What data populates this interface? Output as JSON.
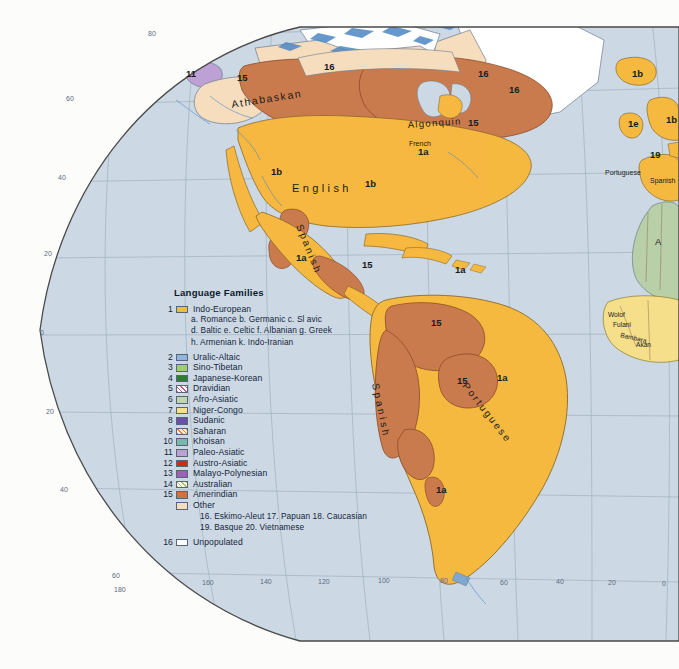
{
  "map": {
    "title": "World Language Families",
    "projection_note": "Western Hemisphere sheet",
    "colors": {
      "ocean": "#ccd9e4",
      "ocean_deep": "#c3d2e0",
      "page": "#fcfcfb",
      "indo_european": "#f6b940",
      "amerindian": "#ca7b4e",
      "other": "#f6dcb8",
      "unpopulated": "#ffffff",
      "afro_asiatic": "#b8cfa8",
      "niger_congo": "#f5df8a",
      "paleo_asiatic": "#c0a0d0",
      "coastline": "#6d7b8c",
      "graticule": "#93a3b4",
      "border": "#8d6d4e"
    },
    "labels": [
      {
        "text": "Athabaskan",
        "x": 268,
        "y": 100,
        "size": 10,
        "style": "spaced-curve",
        "rotate": -12
      },
      {
        "text": "English",
        "x": 305,
        "y": 187,
        "size": 11,
        "style": "spaced",
        "rotate": 0
      },
      {
        "text": "Spanish",
        "x": 300,
        "y": 232,
        "size": 10,
        "style": "spaced-curve",
        "rotate": 72
      },
      {
        "text": "Algonquin",
        "x": 432,
        "y": 125,
        "size": 9,
        "style": "plain",
        "rotate": -4
      },
      {
        "text": "French",
        "x": 419,
        "y": 142,
        "size": 7,
        "style": "plain",
        "rotate": 0
      },
      {
        "text": "Spanish",
        "x": 378,
        "y": 398,
        "size": 10,
        "style": "spaced-curve",
        "rotate": 80
      },
      {
        "text": "Portuguese",
        "x": 478,
        "y": 400,
        "size": 10,
        "style": "spaced-curve",
        "rotate": 55
      },
      {
        "text": "Portuguese",
        "x": 612,
        "y": 172,
        "size": 7,
        "style": "plain",
        "rotate": 0
      },
      {
        "text": "Spanish",
        "x": 655,
        "y": 180,
        "size": 7,
        "style": "plain",
        "rotate": 0
      },
      {
        "text": "Wolof",
        "x": 613,
        "y": 314,
        "size": 6.5,
        "style": "plain",
        "rotate": 0
      },
      {
        "text": "Fulani",
        "x": 618,
        "y": 324,
        "size": 6.5,
        "style": "plain",
        "rotate": 0
      },
      {
        "text": "Bambara",
        "x": 627,
        "y": 333,
        "size": 6.5,
        "style": "plain",
        "rotate": 12
      },
      {
        "text": "Akan",
        "x": 641,
        "y": 343,
        "size": 6.5,
        "style": "plain",
        "rotate": 0
      },
      {
        "text": "A",
        "x": 657,
        "y": 241,
        "size": 9,
        "style": "plain",
        "rotate": 0
      }
    ],
    "region_codes": [
      {
        "code": "11",
        "x": 190,
        "y": 74
      },
      {
        "code": "15",
        "x": 243,
        "y": 78
      },
      {
        "code": "16",
        "x": 330,
        "y": 67
      },
      {
        "code": "16",
        "x": 484,
        "y": 74
      },
      {
        "code": "16",
        "x": 514,
        "y": 90
      },
      {
        "code": "15",
        "x": 474,
        "y": 123
      },
      {
        "code": "1a",
        "x": 424,
        "y": 152
      },
      {
        "code": "1b",
        "x": 277,
        "y": 172
      },
      {
        "code": "1b",
        "x": 371,
        "y": 184
      },
      {
        "code": "1b",
        "x": 638,
        "y": 74
      },
      {
        "code": "1e",
        "x": 634,
        "y": 124
      },
      {
        "code": "1b",
        "x": 670,
        "y": 120
      },
      {
        "code": "19",
        "x": 655,
        "y": 155
      },
      {
        "code": "1a",
        "x": 302,
        "y": 258
      },
      {
        "code": "15",
        "x": 368,
        "y": 265
      },
      {
        "code": "1a",
        "x": 461,
        "y": 270
      },
      {
        "code": "15",
        "x": 437,
        "y": 323
      },
      {
        "code": "15",
        "x": 463,
        "y": 381
      },
      {
        "code": "1a",
        "x": 503,
        "y": 378
      },
      {
        "code": "1a",
        "x": 442,
        "y": 490
      }
    ],
    "graticule": {
      "longitude_labels": [
        "180",
        "160",
        "140",
        "120",
        "100",
        "80",
        "60",
        "40",
        "20",
        "0"
      ],
      "latitude_labels_left": [
        "80",
        "60",
        "40",
        "20",
        "0",
        "20",
        "40",
        "60"
      ],
      "latitude_labels_top": [
        "80"
      ]
    }
  },
  "legend": {
    "title": "Language Families",
    "items": [
      {
        "num": "1",
        "label": "Indo-European",
        "swatch": "#f6b940",
        "kind": "solid"
      },
      {
        "num": "2",
        "label": "Uralic-Altaic",
        "swatch": "#8fb6e0",
        "kind": "solid"
      },
      {
        "num": "3",
        "label": "Sino-Tibetan",
        "swatch": "#9dcf72",
        "kind": "solid"
      },
      {
        "num": "4",
        "label": "Japanese-Korean",
        "swatch": "#2e7d32",
        "kind": "solid"
      },
      {
        "num": "5",
        "label": "Dravidian",
        "swatch": "#ffffff",
        "kind": "hatch-drav"
      },
      {
        "num": "6",
        "label": "Afro-Asiatic",
        "swatch": "#bdd6b0",
        "kind": "solid"
      },
      {
        "num": "7",
        "label": "Niger-Congo",
        "swatch": "#f7e08c",
        "kind": "solid"
      },
      {
        "num": "8",
        "label": "Sudanic",
        "swatch": "#6b4fa8",
        "kind": "solid"
      },
      {
        "num": "9",
        "label": "Saharan",
        "swatch": "#f0a93c",
        "kind": "hatch-sahara"
      },
      {
        "num": "10",
        "label": "Khoisan",
        "swatch": "#78b9ad",
        "kind": "solid"
      },
      {
        "num": "11",
        "label": "Paleo-Asiatic",
        "swatch": "#bda0d4",
        "kind": "solid"
      },
      {
        "num": "12",
        "label": "Austro-Asiatic",
        "swatch": "#c7330f",
        "kind": "solid"
      },
      {
        "num": "13",
        "label": "Malayo-Polynesian",
        "swatch": "#9b62b8",
        "kind": "solid"
      },
      {
        "num": "14",
        "label": "Australian",
        "swatch": "#ffffff",
        "kind": "hatch-austr"
      },
      {
        "num": "15",
        "label": "Amerindian",
        "swatch": "#d4703f",
        "kind": "solid"
      },
      {
        "num": "",
        "label": "Other",
        "swatch": "#f6ddbe",
        "kind": "solid"
      }
    ],
    "indo_european_sub_1": "a. Romance  b. Germanic  c. Sl avic",
    "indo_european_sub_2": "d. Baltic  e. Celtic  f. Albanian  g. Greek",
    "indo_european_sub_3": "h. Armenian  k. Indo-Iranian",
    "other_sub_1": "16. Eskimo-Aleut  17. Papuan  18. Caucasian",
    "other_sub_2": "19. Basque  20. Vietnamese",
    "unpopulated": {
      "num": "16",
      "label": "Unpopulated",
      "swatch": "#ffffff"
    }
  }
}
